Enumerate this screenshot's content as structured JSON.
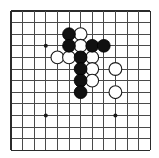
{
  "figure": {
    "kind": "go-board-diagram",
    "width": 159,
    "height": 158
  },
  "board": {
    "columns": 13,
    "rows": 13,
    "origin_x": 11,
    "origin_y": 11,
    "spacing": 11.6,
    "line_color": "#4a4a4a",
    "edge_color": "#2b2b2b",
    "background_color": "#ffffff",
    "star_point_radius": 2,
    "stone_radius": 6.4,
    "star_points": [
      {
        "col": 3,
        "row": 3
      },
      {
        "col": 3,
        "row": 9
      },
      {
        "col": 9,
        "row": 9
      }
    ]
  },
  "stones": {
    "black_color": "#111111",
    "white_color": "#ffffff",
    "black": [
      {
        "col": 5,
        "row": 2
      },
      {
        "col": 5,
        "row": 3
      },
      {
        "col": 7,
        "row": 3
      },
      {
        "col": 8,
        "row": 3
      },
      {
        "col": 6,
        "row": 4
      },
      {
        "col": 6,
        "row": 5
      },
      {
        "col": 6,
        "row": 6
      },
      {
        "col": 6,
        "row": 7
      }
    ],
    "white": [
      {
        "col": 6,
        "row": 2
      },
      {
        "col": 6,
        "row": 3
      },
      {
        "col": 4,
        "row": 4
      },
      {
        "col": 5,
        "row": 4
      },
      {
        "col": 7,
        "row": 4
      },
      {
        "col": 7,
        "row": 5
      },
      {
        "col": 7,
        "row": 6
      },
      {
        "col": 9,
        "row": 5
      },
      {
        "col": 9,
        "row": 7
      }
    ]
  },
  "chart_data": {
    "type": "table",
    "xlabel": "column",
    "ylabel": "row",
    "columns": [
      "color",
      "col",
      "row"
    ],
    "values": [
      [
        "black",
        5,
        2
      ],
      [
        "white",
        6,
        2
      ],
      [
        "black",
        5,
        3
      ],
      [
        "white",
        6,
        3
      ],
      [
        "black",
        7,
        3
      ],
      [
        "black",
        8,
        3
      ],
      [
        "white",
        4,
        4
      ],
      [
        "white",
        5,
        4
      ],
      [
        "black",
        6,
        4
      ],
      [
        "white",
        7,
        4
      ],
      [
        "black",
        6,
        5
      ],
      [
        "white",
        7,
        5
      ],
      [
        "white",
        9,
        5
      ],
      [
        "black",
        6,
        6
      ],
      [
        "white",
        7,
        6
      ],
      [
        "black",
        6,
        7
      ],
      [
        "white",
        9,
        7
      ]
    ]
  }
}
